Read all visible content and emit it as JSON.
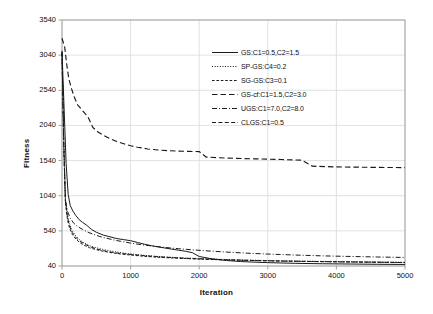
{
  "chart_data": {
    "type": "line",
    "title": "",
    "xlabel": "Iteration",
    "ylabel": "Fitness",
    "xlim": [
      0,
      5000
    ],
    "ylim": [
      40,
      3540
    ],
    "xticks": [
      0,
      1000,
      2000,
      3000,
      4000,
      5000
    ],
    "yticks": [
      40,
      540,
      1040,
      1540,
      2040,
      2540,
      3040,
      3540
    ],
    "grid": true,
    "legend_position": "upper right",
    "series": [
      {
        "name": "GS:C1=0.5,C2=1.5",
        "dash": "solid",
        "color": "#1a1a1a",
        "x": [
          0,
          30,
          60,
          90,
          120,
          160,
          200,
          250,
          300,
          360,
          430,
          500,
          600,
          700,
          800,
          900,
          1000,
          1100,
          1200,
          1300,
          1400,
          1500,
          1600,
          1700,
          1800,
          1900,
          2000,
          2200,
          2400,
          2600,
          2800,
          3000,
          3400,
          3800,
          4200,
          4600,
          5000
        ],
        "y": [
          3100,
          2300,
          1500,
          1060,
          900,
          820,
          760,
          700,
          660,
          620,
          560,
          520,
          480,
          455,
          430,
          415,
          400,
          375,
          350,
          330,
          312,
          296,
          280,
          265,
          250,
          230,
          175,
          140,
          118,
          104,
          95,
          88,
          78,
          72,
          68,
          64,
          62
        ]
      },
      {
        "name": "SP-GS:C4=0.2",
        "dash": "dotted",
        "color": "#1a1a1a",
        "x": [
          0,
          25,
          50,
          80,
          110,
          150,
          200,
          260,
          320,
          400,
          500,
          600,
          700,
          800,
          900,
          1000,
          1200,
          1400,
          1600,
          1800,
          2000,
          2400,
          2800,
          3200,
          3600,
          4000,
          4400,
          5000
        ],
        "y": [
          3080,
          1900,
          1000,
          760,
          640,
          540,
          470,
          410,
          370,
          330,
          300,
          275,
          255,
          238,
          224,
          212,
          192,
          176,
          164,
          154,
          146,
          132,
          122,
          114,
          108,
          102,
          98,
          92
        ]
      },
      {
        "name": "SG-GS:C3=0.1",
        "dash": "dashed-short",
        "color": "#1a1a1a",
        "x": [
          0,
          25,
          50,
          80,
          110,
          150,
          200,
          260,
          320,
          400,
          500,
          600,
          700,
          800,
          900,
          1000,
          1200,
          1400,
          1600,
          1800,
          2000,
          2400,
          2800,
          3200,
          3600,
          4000,
          4400,
          5000
        ],
        "y": [
          3060,
          1800,
          930,
          700,
          580,
          490,
          425,
          372,
          336,
          300,
          272,
          250,
          232,
          218,
          206,
          196,
          178,
          164,
          154,
          146,
          138,
          126,
          118,
          110,
          105,
          100,
          96,
          90
        ]
      },
      {
        "name": "GS-cf:C1=1.5,C2=3.0",
        "dash": "dashed-long",
        "color": "#1a1a1a",
        "x": [
          0,
          40,
          70,
          100,
          140,
          180,
          230,
          300,
          380,
          450,
          520,
          600,
          700,
          800,
          900,
          1000,
          1100,
          1250,
          1400,
          1550,
          1700,
          1850,
          2000,
          2100,
          2400,
          2800,
          3200,
          3500,
          3650,
          4000,
          4400,
          4700,
          5000
        ],
        "y": [
          3280,
          3150,
          2900,
          2700,
          2560,
          2440,
          2330,
          2250,
          2160,
          2010,
          1950,
          1900,
          1850,
          1810,
          1780,
          1750,
          1730,
          1705,
          1690,
          1680,
          1675,
          1670,
          1668,
          1590,
          1575,
          1565,
          1555,
          1545,
          1460,
          1450,
          1445,
          1442,
          1440
        ]
      },
      {
        "name": "UGS:C1=7.0,C2=8.0",
        "dash": "dash-dot",
        "color": "#1a1a1a",
        "x": [
          0,
          25,
          50,
          80,
          120,
          170,
          230,
          300,
          380,
          460,
          550,
          650,
          750,
          850,
          1000,
          1150,
          1300,
          1500,
          1700,
          1900,
          2100,
          2400,
          2700,
          3000,
          3400,
          3800,
          4200,
          4600,
          5000
        ],
        "y": [
          3090,
          1700,
          980,
          820,
          720,
          650,
          600,
          560,
          520,
          490,
          460,
          435,
          412,
          392,
          366,
          344,
          326,
          304,
          286,
          270,
          256,
          238,
          222,
          210,
          196,
          184,
          176,
          168,
          162
        ]
      },
      {
        "name": "CLGS:C1=0.5",
        "dash": "dash-med",
        "color": "#1a1a1a",
        "x": [
          0,
          25,
          50,
          80,
          110,
          150,
          200,
          260,
          330,
          400,
          480,
          560,
          650,
          750,
          850,
          1000,
          1200,
          1400,
          1600,
          1800,
          2000,
          2400,
          2800,
          3200,
          3600,
          4000,
          4400,
          5000
        ],
        "y": [
          3070,
          1850,
          960,
          730,
          610,
          515,
          448,
          392,
          352,
          318,
          290,
          268,
          248,
          232,
          218,
          205,
          186,
          172,
          160,
          150,
          142,
          128,
          118,
          110,
          104,
          99,
          95,
          89
        ]
      }
    ]
  },
  "legend": {
    "items": [
      {
        "label": "GS:C1=0.5,C2=1.5"
      },
      {
        "label": "SP-GS:C4=0.2"
      },
      {
        "label": "SG-GS:C3=0.1"
      },
      {
        "label": "GS-cf:C1=1.5,C2=3.0"
      },
      {
        "label": "UGS:C1=7.0,C2=8.0"
      },
      {
        "label": "CLGS:C1=0.5"
      }
    ]
  },
  "style": {
    "line_color": "#1a1a1a",
    "grid_color": "#d9d9d9",
    "axis_color": "#9a9a9a",
    "background": "#ffffff"
  }
}
